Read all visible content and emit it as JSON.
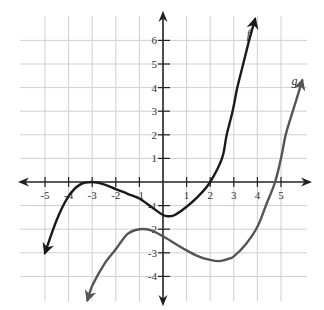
{
  "chart_data": {
    "type": "line",
    "title": "",
    "xlabel": "",
    "ylabel": "",
    "xlim": [
      -6,
      6
    ],
    "ylim": [
      -5,
      7
    ],
    "grid": true,
    "x_ticks": [
      -5,
      -4,
      -3,
      -2,
      -1,
      1,
      2,
      3,
      4,
      5
    ],
    "y_ticks": [
      -4,
      -3,
      -2,
      -1,
      1,
      2,
      3,
      4,
      5,
      6
    ],
    "x_tick_labels": [
      "-5",
      "-4",
      "-3",
      "-2",
      "-1",
      "1",
      "2",
      "3",
      "4",
      "5"
    ],
    "y_tick_labels": [
      "-4",
      "-3",
      "-2",
      "-1",
      "1",
      "2",
      "3",
      "4",
      "5",
      "6"
    ],
    "series": [
      {
        "name": "f",
        "color": "#1a1a1a",
        "points": [
          [
            -5.0,
            -3.0
          ],
          [
            -4.5,
            -1.6
          ],
          [
            -4.0,
            -0.6
          ],
          [
            -3.5,
            -0.1
          ],
          [
            -3.0,
            0.0
          ],
          [
            -2.5,
            -0.1
          ],
          [
            -2.0,
            -0.3
          ],
          [
            -1.5,
            -0.5
          ],
          [
            -1.0,
            -0.7
          ],
          [
            -0.5,
            -1.05
          ],
          [
            0.0,
            -1.4
          ],
          [
            0.25,
            -1.45
          ],
          [
            0.5,
            -1.4
          ],
          [
            1.0,
            -1.05
          ],
          [
            1.5,
            -0.6
          ],
          [
            2.0,
            0.0
          ],
          [
            2.5,
            1.0
          ],
          [
            2.7,
            2.0
          ],
          [
            2.95,
            3.0
          ],
          [
            3.15,
            4.0
          ],
          [
            3.4,
            5.0
          ],
          [
            3.65,
            6.0
          ],
          [
            3.9,
            6.9
          ]
        ],
        "label": "f",
        "label_pos": [
          3.55,
          6.1
        ]
      },
      {
        "name": "g",
        "color": "#555555",
        "points": [
          [
            -3.2,
            -5.0
          ],
          [
            -3.0,
            -4.4
          ],
          [
            -2.5,
            -3.5
          ],
          [
            -2.0,
            -2.85
          ],
          [
            -1.5,
            -2.2
          ],
          [
            -1.0,
            -2.0
          ],
          [
            -0.5,
            -2.05
          ],
          [
            0.0,
            -2.3
          ],
          [
            0.5,
            -2.6
          ],
          [
            1.0,
            -2.9
          ],
          [
            1.5,
            -3.15
          ],
          [
            2.0,
            -3.3
          ],
          [
            2.4,
            -3.35
          ],
          [
            2.8,
            -3.25
          ],
          [
            3.0,
            -3.15
          ],
          [
            3.5,
            -2.65
          ],
          [
            4.0,
            -1.9
          ],
          [
            4.4,
            -0.9
          ],
          [
            4.75,
            0.0
          ],
          [
            5.0,
            1.0
          ],
          [
            5.2,
            2.0
          ],
          [
            5.5,
            3.0
          ],
          [
            5.9,
            4.3
          ]
        ],
        "label": "g",
        "label_pos": [
          5.45,
          4.1
        ]
      }
    ],
    "arrows": {
      "f": [
        "start",
        "end"
      ],
      "g": [
        "start",
        "end"
      ]
    }
  }
}
